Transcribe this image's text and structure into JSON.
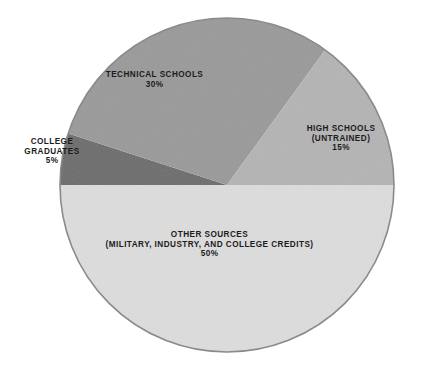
{
  "chart_data": {
    "type": "pie",
    "title": "",
    "subtitle": "",
    "xlabel": "",
    "ylabel": "",
    "legend_position": "none",
    "grid": false,
    "units": "percent",
    "start_angle_deg": 0,
    "direction": "counterclockwise",
    "categories": [
      "HIGH SCHOOLS (UNTRAINED)",
      "TECHNICAL SCHOOLS",
      "COLLEGE GRADUATES",
      "OTHER SOURCES (MILITARY, INDUSTRY, AND COLLEGE CREDITS)"
    ],
    "values": [
      15,
      30,
      5,
      50
    ],
    "slices": [
      {
        "key": "high-schools",
        "label_lines": [
          "HIGH SCHOOLS",
          "(UNTRAINED)"
        ],
        "value": 15,
        "value_text": "15%",
        "color": "#b4b4b4",
        "start_deg": 0,
        "end_deg": 54,
        "label_placement": "inside"
      },
      {
        "key": "technical-schools",
        "label_lines": [
          "TECHNICAL SCHOOLS"
        ],
        "value": 30,
        "value_text": "30%",
        "color": "#9a9a9a",
        "start_deg": 54,
        "end_deg": 162,
        "label_placement": "inside"
      },
      {
        "key": "college-graduates",
        "label_lines": [
          "COLLEGE",
          "GRADUATES"
        ],
        "value": 5,
        "value_text": "5%",
        "color": "#6d6d6d",
        "start_deg": 162,
        "end_deg": 180,
        "label_placement": "outside-left"
      },
      {
        "key": "other-sources",
        "label_lines": [
          "OTHER SOURCES",
          "(MILITARY, INDUSTRY, AND COLLEGE CREDITS)"
        ],
        "value": 50,
        "value_text": "50%",
        "color": "#dcdcdc",
        "start_deg": 180,
        "end_deg": 360,
        "label_placement": "inside"
      }
    ],
    "outline_color": "#8a8a8a",
    "background_color": "#ffffff",
    "label_text_color": "#1c1c1c",
    "geometry": {
      "center_x": 227,
      "center_y": 185,
      "radius": 167
    }
  },
  "labels": {
    "technical_schools": {
      "line1": "TECHNICAL SCHOOLS",
      "value": "30%"
    },
    "high_schools": {
      "line1": "HIGH SCHOOLS",
      "line2": "(UNTRAINED)",
      "value": "15%"
    },
    "college_graduates": {
      "line1": "COLLEGE",
      "line2": "GRADUATES",
      "value": "5%"
    },
    "other_sources": {
      "line1": "OTHER SOURCES",
      "line2": "(MILITARY, INDUSTRY, AND COLLEGE CREDITS)",
      "value": "50%"
    }
  }
}
